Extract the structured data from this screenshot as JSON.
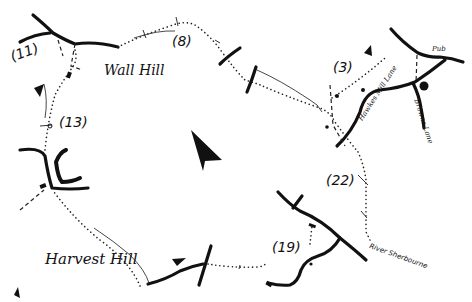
{
  "map": {
    "type": "walking-route-sketch-map",
    "place_labels": [
      {
        "id": "wall-hill",
        "text": "Wall Hill"
      },
      {
        "id": "harvest-hill",
        "text": "Harvest Hill"
      }
    ],
    "road_labels": [
      {
        "id": "hawkes-mill-lane",
        "text": "Hawkes Mill Lane"
      },
      {
        "id": "browns-lane",
        "text": "Browns Lane"
      },
      {
        "id": "river-sherbourne",
        "text": "River Sherbourne"
      },
      {
        "id": "pub",
        "text": "Pub"
      }
    ],
    "waypoints": [
      {
        "id": "wp-3",
        "text": "(3)"
      },
      {
        "id": "wp-8",
        "text": "(8)"
      },
      {
        "id": "wp-11",
        "text": "(11)"
      },
      {
        "id": "wp-13",
        "text": "(13)"
      },
      {
        "id": "wp-19",
        "text": "(19)"
      },
      {
        "id": "wp-22",
        "text": "(22)"
      }
    ],
    "icons": {
      "north_arrow": "north-arrow-icon",
      "direction_arrows": "direction-arrow-icon"
    },
    "colors": {
      "ink": "#111111",
      "paper": "#ffffff"
    }
  }
}
